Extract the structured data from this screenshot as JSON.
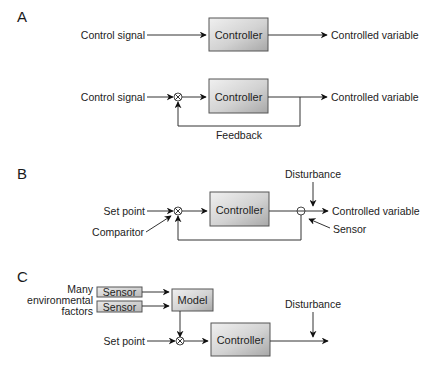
{
  "colors": {
    "line": "#333333",
    "box_light": "#ececec",
    "box_dark": "#b4b4b4",
    "text": "#222222"
  },
  "panels": {
    "A": {
      "label": "A",
      "open_loop": {
        "input": "Control signal",
        "block": "Controller",
        "output": "Controlled variable"
      },
      "closed_loop": {
        "input": "Control signal",
        "comparator": "comparator-symbol",
        "block": "Controller",
        "output": "Controlled variable",
        "feedback": "Feedback"
      }
    },
    "B": {
      "label": "B",
      "input": "Set point",
      "comparator_label": "Comparitor",
      "block": "Controller",
      "disturbance": "Disturbance",
      "output": "Controlled variable",
      "sensor_label": "Sensor"
    },
    "C": {
      "label": "C",
      "factors_label_lines": [
        "Many",
        "environmental",
        "factors"
      ],
      "sensors": [
        "Sensor",
        "Sensor"
      ],
      "model": "Model",
      "input": "Set point",
      "block": "Controller",
      "disturbance": "Disturbance"
    }
  },
  "icons": {
    "comparator": "circle-times-icon",
    "sensor_node": "circle-minus-icon",
    "arrowhead": "arrowhead-icon"
  }
}
